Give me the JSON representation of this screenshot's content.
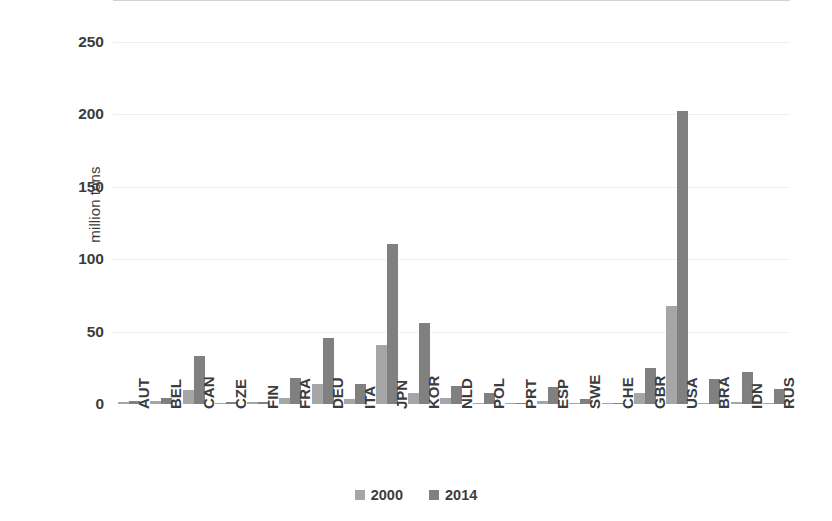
{
  "chart_data": {
    "type": "bar",
    "title": "",
    "subtitle": "",
    "xlabel": "",
    "ylabel": "million tons",
    "ylim": [
      0,
      250
    ],
    "yticks": [
      0,
      50,
      100,
      150,
      200,
      250
    ],
    "ytick_labels": [
      "0",
      "50",
      "100",
      "150",
      "200",
      "250"
    ],
    "grid": true,
    "legend_position": "bottom",
    "categories": [
      "AUT",
      "BEL",
      "CAN",
      "CZE",
      "FIN",
      "FRA",
      "DEU",
      "ITA",
      "JPN",
      "KOR",
      "NLD",
      "POL",
      "PRT",
      "ESP",
      "SWE",
      "CHE",
      "GBR",
      "USA",
      "BRA",
      "IDN",
      "RUS"
    ],
    "series": [
      {
        "name": "2000",
        "color": "#a6a6a6",
        "values": [
          1.2,
          2.2,
          10.0,
          0.8,
          1.5,
          4.0,
          14.0,
          3.5,
          40.5,
          7.5,
          4.0,
          0.6,
          0.8,
          2.0,
          0.8,
          1.0,
          7.5,
          68.0,
          0.5,
          1.5,
          0.5
        ]
      },
      {
        "name": "2014",
        "color": "#808080",
        "values": [
          2.2,
          4.0,
          33.0,
          1.2,
          1.5,
          18.0,
          45.5,
          14.0,
          110.5,
          56.0,
          12.5,
          7.5,
          0.4,
          11.5,
          3.5,
          0.6,
          25.0,
          202.5,
          17.0,
          22.0,
          10.5
        ]
      }
    ]
  },
  "legend": {
    "items": [
      {
        "label": "2000",
        "color": "#a6a6a6"
      },
      {
        "label": "2014",
        "color": "#808080"
      }
    ]
  },
  "colors": {
    "background": "#ffffff",
    "gridline": "#efefef",
    "axis_line": "#d3d3d3",
    "text": "#3c3c3c"
  }
}
